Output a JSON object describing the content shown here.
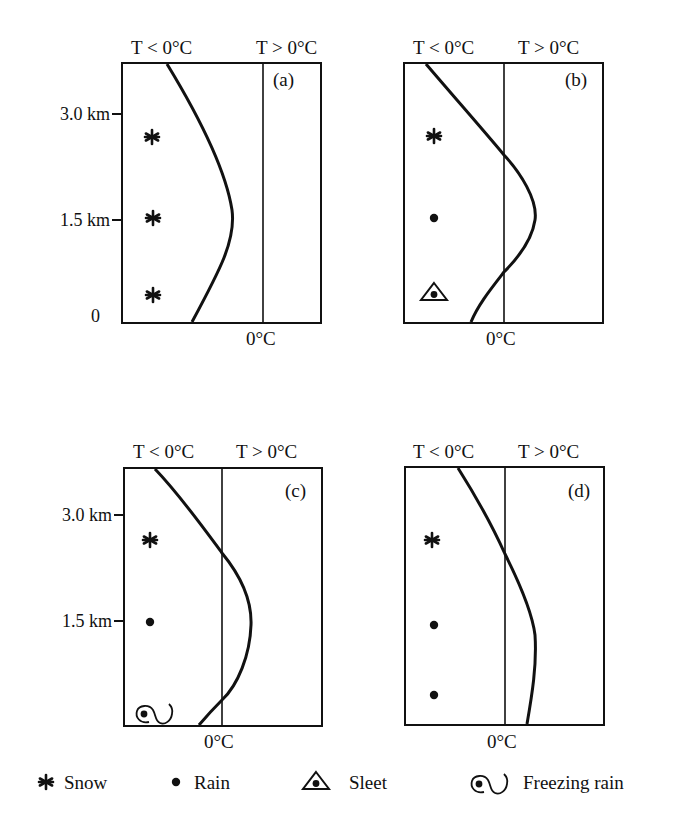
{
  "header_labels": {
    "cold": "T < 0°C",
    "warm": "T > 0°C",
    "zero": "0°C"
  },
  "y_axis": {
    "ticks": [
      "3.0 km",
      "1.5 km",
      "0"
    ]
  },
  "panels": [
    {
      "id": "a",
      "label": "(a)",
      "precip": [
        "snow",
        "snow",
        "snow"
      ],
      "description": "Entire column below freezing"
    },
    {
      "id": "b",
      "label": "(b)",
      "precip": [
        "snow",
        "rain",
        "sleet"
      ],
      "description": "Warm layer aloft, deep cold layer near surface"
    },
    {
      "id": "c",
      "label": "(c)",
      "precip": [
        "snow",
        "rain",
        "freezing-rain"
      ],
      "description": "Warm layer aloft, shallow cold layer at surface"
    },
    {
      "id": "d",
      "label": "(d)",
      "precip": [
        "snow",
        "rain",
        "rain"
      ],
      "description": "Above-freezing temperatures from mid-levels to surface"
    }
  ],
  "legend": [
    {
      "symbol": "snow-icon",
      "label": "Snow"
    },
    {
      "symbol": "rain-icon",
      "label": "Rain"
    },
    {
      "symbol": "sleet-icon",
      "label": "Sleet"
    },
    {
      "symbol": "freezing-rain-icon",
      "label": "Freezing rain"
    }
  ],
  "colors": {
    "ink": "#111111",
    "background": "#ffffff"
  }
}
